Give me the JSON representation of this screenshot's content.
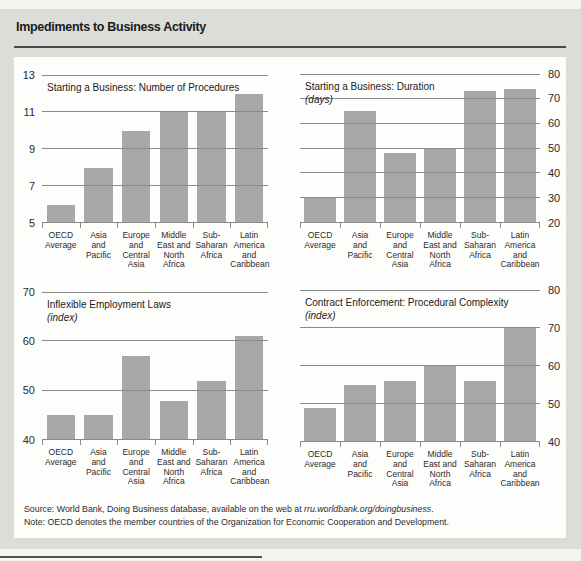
{
  "header": {
    "title": "Impediments to Business Activity"
  },
  "categories": [
    "OECD Average",
    "Asia and Pacific",
    "Europe and Central Asia",
    "Middle East and North Africa",
    "Sub-Saharan Africa",
    "Latin America and Caribbean"
  ],
  "category_label_lines": [
    "OECD\nAverage",
    "Asia\nand\nPacific",
    "Europe\nand\nCentral\nAsia",
    "Middle\nEast and\nNorth\nAfrica",
    "Sub-\nSaharan\nAfrica",
    "Latin\nAmerica\nand\nCaribbean"
  ],
  "chart_data": [
    {
      "type": "bar",
      "title": "Starting a Business: Number of Procedures",
      "subtitle": "",
      "axis_side": "left",
      "ylim": [
        5,
        13
      ],
      "yticks": [
        5,
        7,
        9,
        11,
        13
      ],
      "grid": true,
      "categories": [
        "OECD Average",
        "Asia and Pacific",
        "Europe and Central Asia",
        "Middle East and North Africa",
        "Sub-Saharan Africa",
        "Latin America and Caribbean"
      ],
      "values": [
        6,
        8,
        10,
        11,
        11,
        12
      ]
    },
    {
      "type": "bar",
      "title": "Starting a Business: Duration",
      "subtitle": "(days)",
      "axis_side": "right",
      "ylim": [
        20,
        80
      ],
      "yticks": [
        20,
        30,
        40,
        50,
        60,
        70,
        80
      ],
      "grid": true,
      "categories": [
        "OECD Average",
        "Asia and Pacific",
        "Europe and Central Asia",
        "Middle East and North Africa",
        "Sub-Saharan Africa",
        "Latin America and Caribbean"
      ],
      "values": [
        30,
        65,
        48,
        50,
        73,
        74
      ]
    },
    {
      "type": "bar",
      "title": "Inflexible Employment Laws",
      "subtitle": "(index)",
      "axis_side": "left",
      "ylim": [
        40,
        70
      ],
      "yticks": [
        40,
        50,
        60,
        70
      ],
      "grid": true,
      "categories": [
        "OECD Average",
        "Asia and Pacific",
        "Europe and Central Asia",
        "Middle East and North Africa",
        "Sub-Saharan Africa",
        "Latin America and Caribbean"
      ],
      "values": [
        45,
        45,
        57,
        48,
        52,
        61
      ]
    },
    {
      "type": "bar",
      "title": "Contract Enforcement: Procedural Complexity",
      "subtitle": "(index)",
      "axis_side": "right",
      "ylim": [
        40,
        80
      ],
      "yticks": [
        40,
        50,
        60,
        70,
        80
      ],
      "grid": true,
      "categories": [
        "OECD Average",
        "Asia and Pacific",
        "Europe and Central Asia",
        "Middle East and North Africa",
        "Sub-Saharan Africa",
        "Latin America and Caribbean"
      ],
      "values": [
        49,
        55,
        56,
        60,
        56,
        70
      ]
    }
  ],
  "footer": {
    "source_prefix": "Source: World Bank, Doing Business database, available on the web at ",
    "source_link": "rru.worldbank.org/doingbusiness",
    "source_suffix": ".",
    "note": "Note: OECD denotes the member countries of the Organization for Economic Cooperation and Development."
  },
  "colors": {
    "bar": "#a8a8a8",
    "gridline": "#8a8a8a",
    "panel": "#fdfdfc",
    "page_gray": "#dcdcd9",
    "page_light": "#f4f4f1",
    "rule": "#4a4a4a",
    "text": "#2b2b2b"
  }
}
